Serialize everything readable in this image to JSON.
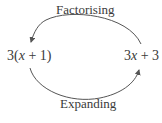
{
  "diagram": {
    "top_label": "Factorising",
    "bottom_label": "Expanding",
    "left_expression": {
      "prefix": "3(",
      "var": "x",
      "suffix": " + 1)"
    },
    "right_expression": {
      "prefix": "3",
      "var": "x",
      "suffix": " + 3"
    },
    "arrows": [
      {
        "from": "right_expression",
        "to": "left_expression",
        "label": "Factorising",
        "path": "top"
      },
      {
        "from": "left_expression",
        "to": "right_expression",
        "label": "Expanding",
        "path": "bottom"
      }
    ],
    "line_color": "#555555"
  }
}
